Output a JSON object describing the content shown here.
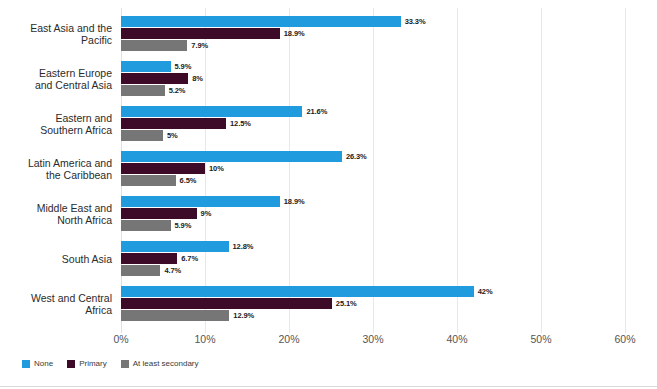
{
  "chart_data": {
    "type": "bar",
    "orientation": "horizontal",
    "title": "",
    "xlabel": "",
    "ylabel": "",
    "xlim": [
      0,
      60
    ],
    "xunit": "%",
    "grid": true,
    "legend_position": "bottom-left",
    "categories": [
      "East Asia and the Pacific",
      "Eastern Europe and Central Asia",
      "Eastern and Southern Africa",
      "Latin America and the Caribbean",
      "Middle East and North Africa",
      "South Asia",
      "West and Central Africa"
    ],
    "category_lines": [
      [
        "East Asia and the",
        "Pacific"
      ],
      [
        "Eastern Europe",
        "and Central Asia"
      ],
      [
        "Eastern and",
        "Southern Africa"
      ],
      [
        "Latin America and",
        "the Caribbean"
      ],
      [
        "Middle East and",
        "North Africa"
      ],
      [
        "South Asia"
      ],
      [
        "West and Central",
        "Africa"
      ]
    ],
    "tick_labels": [
      "0%",
      "10%",
      "20%",
      "30%",
      "40%",
      "50%",
      "60%"
    ],
    "tick_values": [
      0,
      10,
      20,
      30,
      40,
      50,
      60
    ],
    "series": [
      {
        "name": "None",
        "color": "#1f9bde",
        "values": [
          33.3,
          5.9,
          21.6,
          26.3,
          18.9,
          12.8,
          42
        ],
        "labels": [
          "33.3%",
          "5.9%",
          "21.6%",
          "26.3%",
          "18.9%",
          "12.8%",
          "42%"
        ]
      },
      {
        "name": "Primary",
        "color": "#3d0a28",
        "values": [
          18.9,
          8,
          12.5,
          10,
          9,
          6.7,
          25.1
        ],
        "labels": [
          "18.9%",
          "8%",
          "12.5%",
          "10%",
          "9%",
          "6.7%",
          "25.1%"
        ]
      },
      {
        "name": "At least secondary",
        "color": "#767676",
        "values": [
          7.9,
          5.2,
          5,
          6.5,
          5.9,
          4.7,
          12.9
        ],
        "labels": [
          "7.9%",
          "5.2%",
          "5%",
          "6.5%",
          "5.9%",
          "4.7%",
          "12.9%"
        ]
      }
    ]
  },
  "legend": {
    "items": [
      {
        "label": "None",
        "color": "#1f9bde"
      },
      {
        "label": "Primary",
        "color": "#3d0a28"
      },
      {
        "label": "At least secondary",
        "color": "#767676"
      }
    ]
  },
  "colors": {
    "none": "#1f9bde",
    "primary": "#3d0a28",
    "secondary": "#767676",
    "grid": "#e8e8e8",
    "text": "#2b2b2b",
    "value_text": "#1a1a1a",
    "background": "#ffffff"
  }
}
